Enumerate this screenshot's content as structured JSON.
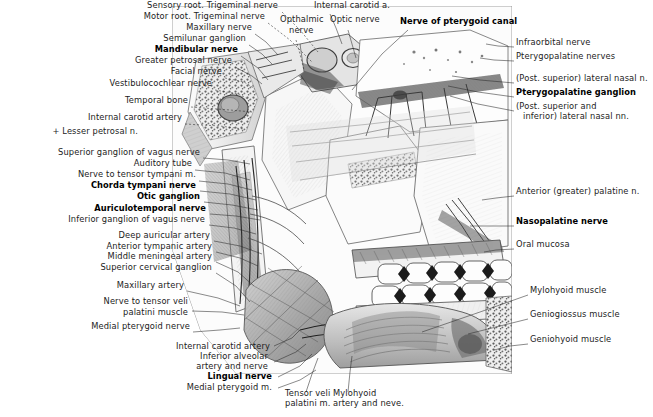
{
  "figure": {
    "kind": "anatomical-illustration",
    "background": "#ffffff",
    "ink": "#1c1c1c",
    "plate_bounds": {
      "x": 170,
      "y": 5,
      "width": 343,
      "height": 370
    }
  },
  "labels_left": [
    {
      "text": "Sensory root. Trigeminal nerve",
      "x": 278,
      "y": 8,
      "bold": false
    },
    {
      "text": "Motor root. Trigeminal nerve",
      "x": 265,
      "y": 19,
      "bold": false
    },
    {
      "text": "Maxillary nerve",
      "x": 252,
      "y": 30,
      "bold": false
    },
    {
      "text": "Semilunar ganglion",
      "x": 246,
      "y": 41,
      "bold": false
    },
    {
      "text": "Mandibular nerve",
      "x": 238,
      "y": 52,
      "bold": true
    },
    {
      "text": "Greater petrosal nerve",
      "x": 232,
      "y": 63,
      "bold": false
    },
    {
      "text": "Facial nerve",
      "x": 222,
      "y": 74,
      "bold": false
    },
    {
      "text": "Vestibulocochlear nerve",
      "x": 212,
      "y": 86,
      "bold": false
    },
    {
      "text": "Temporal bone",
      "x": 188,
      "y": 103,
      "bold": false
    },
    {
      "text": "Internal carotid artery",
      "x": 182,
      "y": 120,
      "bold": false
    },
    {
      "text": "+ Lesser petrosal n.",
      "x": 138,
      "y": 134,
      "bold": false
    },
    {
      "text": "Superior ganglion of vagus nerve",
      "x": 200,
      "y": 155,
      "bold": false
    },
    {
      "text": "Auditory tube",
      "x": 192,
      "y": 166,
      "bold": false
    },
    {
      "text": "Nerve to tensor tympani m.",
      "x": 196,
      "y": 177,
      "bold": false
    },
    {
      "text": "Chorda tympani nerve",
      "x": 196,
      "y": 188,
      "bold": true
    },
    {
      "text": "Otic ganglion",
      "x": 200,
      "y": 199,
      "bold": true
    },
    {
      "text": "Auriculotemporal nerve",
      "x": 206,
      "y": 211,
      "bold": true
    },
    {
      "text": "Inferior ganglion of vagus nerve",
      "x": 205,
      "y": 222,
      "bold": false
    },
    {
      "text": "Deep auricular artery",
      "x": 210,
      "y": 238,
      "bold": false
    },
    {
      "text": "Anterior tympanic artery",
      "x": 212,
      "y": 249,
      "bold": false
    },
    {
      "text": "Middle meningeal artery",
      "x": 212,
      "y": 259,
      "bold": false
    },
    {
      "text": "Superior cervical ganglion",
      "x": 212,
      "y": 270,
      "bold": false
    },
    {
      "text": "Maxillary artery",
      "x": 184,
      "y": 288,
      "bold": false
    },
    {
      "text": "Nerve to tensor veli",
      "x": 188,
      "y": 304,
      "bold": false
    },
    {
      "text": "palatini muscle",
      "x": 188,
      "y": 315,
      "bold": false
    },
    {
      "text": "Medial pterygoid nerve",
      "x": 190,
      "y": 329,
      "bold": false
    }
  ],
  "labels_bottom": [
    {
      "text": "Internal carotid artery",
      "x": 270,
      "y": 349,
      "bold": false,
      "align": "right"
    },
    {
      "text": "Inferior alveolar",
      "x": 268,
      "y": 359,
      "bold": false,
      "align": "right"
    },
    {
      "text": "artery and nerve",
      "x": 268,
      "y": 369,
      "bold": false,
      "align": "right"
    },
    {
      "text": "Lingual nerve",
      "x": 272,
      "y": 379,
      "bold": true,
      "align": "right"
    },
    {
      "text": "Medial pterygoid m.",
      "x": 272,
      "y": 390,
      "bold": false,
      "align": "right"
    },
    {
      "text": "Tensor veli",
      "x": 285,
      "y": 396,
      "bold": false,
      "align": "left"
    },
    {
      "text": "palatini m.",
      "x": 285,
      "y": 406,
      "bold": false,
      "align": "left"
    },
    {
      "text": "Mylohyoid",
      "x": 333,
      "y": 396,
      "bold": false,
      "align": "left"
    },
    {
      "text": "artery and neve.",
      "x": 333,
      "y": 406,
      "bold": false,
      "align": "left"
    }
  ],
  "labels_top_center": [
    {
      "text": "Internal carotid a.",
      "x": 314,
      "y": 8,
      "bold": false,
      "align": "left"
    },
    {
      "text": "Opthalmic",
      "x": 280,
      "y": 22,
      "bold": false,
      "align": "left"
    },
    {
      "text": "nerve",
      "x": 289,
      "y": 33,
      "bold": false,
      "align": "left"
    },
    {
      "text": "Optic nerve",
      "x": 330,
      "y": 22,
      "bold": false,
      "align": "left"
    },
    {
      "text": "Nerve of pterygoid canal",
      "x": 400,
      "y": 24,
      "bold": true,
      "align": "left"
    }
  ],
  "labels_right": [
    {
      "text": "Infraorbital nerve",
      "x": 516,
      "y": 45,
      "bold": false
    },
    {
      "text": "Pterygopalatine nerves",
      "x": 516,
      "y": 59,
      "bold": false
    },
    {
      "text": "(Post. superior) lateral nasal n.",
      "x": 516,
      "y": 81,
      "bold": false
    },
    {
      "text": "Pterygopalatine ganglion",
      "x": 516,
      "y": 95,
      "bold": true
    },
    {
      "text": "(Post. superior and",
      "x": 516,
      "y": 109,
      "bold": false
    },
    {
      "text": "inferior) lateral nasal nn.",
      "x": 523,
      "y": 119,
      "bold": false
    },
    {
      "text": "Anterior (greater) palatine n.",
      "x": 516,
      "y": 194,
      "bold": false
    },
    {
      "text": "Nasopalatine nerve",
      "x": 516,
      "y": 224,
      "bold": true
    },
    {
      "text": "Oral mucosa",
      "x": 516,
      "y": 247,
      "bold": false
    },
    {
      "text": "Mylohyoid muscle",
      "x": 530,
      "y": 293,
      "bold": false
    },
    {
      "text": "Geniogiossus muscle",
      "x": 530,
      "y": 317,
      "bold": false
    },
    {
      "text": "Geniohyoid muscle",
      "x": 530,
      "y": 342,
      "bold": false
    }
  ],
  "leaders": [
    {
      "name": "sensory-root",
      "d": "M 282 12 L 300 30 L 318 52",
      "dashed": true
    },
    {
      "name": "motor-root",
      "d": "M 268 23 L 290 40 L 312 62",
      "dashed": true
    },
    {
      "name": "maxillary-nerve",
      "d": "M 255 34 L 266 42 L 278 55",
      "dashed": false
    },
    {
      "name": "semilunar-ganglion",
      "d": "M 249 45 L 262 54 L 272 64",
      "dashed": false
    },
    {
      "name": "mandibular-nerve",
      "d": "M 241 56 L 258 68 L 268 80",
      "dashed": false
    },
    {
      "name": "greater-petrosal",
      "d": "M 235 67 L 252 76 L 262 84",
      "dashed": false
    },
    {
      "name": "facial-nerve",
      "d": "M 225 78 L 244 82 L 254 88",
      "dashed": true
    },
    {
      "name": "vestibulocochlear",
      "d": "M 215 90 L 238 94 L 250 100",
      "dashed": true
    },
    {
      "name": "temporal-bone",
      "d": "M 191 107 L 230 110 L 252 112",
      "dashed": true
    },
    {
      "name": "internal-carotid-a-l",
      "d": "M 185 124 L 220 126 L 243 129",
      "dashed": true
    },
    {
      "name": "sup-ganglion-vagus",
      "d": "M 203 158 L 228 160 L 250 164",
      "dashed": false
    },
    {
      "name": "auditory-tube",
      "d": "M 195 170 L 225 173 L 250 180",
      "dashed": false
    },
    {
      "name": "nerve-tensor-tympani",
      "d": "M 199 181 L 228 184 L 252 190",
      "dashed": false
    },
    {
      "name": "chorda-tympani",
      "d": "M 200 191 L 230 194 L 256 200",
      "dashed": false
    },
    {
      "name": "otic-ganglion",
      "d": "M 204 202 L 232 205 L 258 210",
      "dashed": false
    },
    {
      "name": "auriculotemporal",
      "d": "M 210 214 L 236 216 L 260 220",
      "dashed": false
    },
    {
      "name": "inf-ganglion-vagus",
      "d": "M 209 225 L 234 228 L 256 234",
      "dashed": false
    },
    {
      "name": "deep-auricular-a",
      "d": "M 214 241 L 240 246 L 262 254",
      "dashed": false
    },
    {
      "name": "anterior-tympanic-a",
      "d": "M 216 252 L 240 258 L 258 266",
      "dashed": false
    },
    {
      "name": "middle-meningeal-a",
      "d": "M 216 262 L 238 272 L 254 286",
      "dashed": false
    },
    {
      "name": "sup-cervical-gang",
      "d": "M 216 273 L 236 286 L 250 302",
      "dashed": false
    },
    {
      "name": "maxillary-artery",
      "d": "M 187 291 L 218 298 L 240 306",
      "dashed": false
    },
    {
      "name": "tensor-veli-pal-n",
      "d": "M 192 311 L 222 312 L 244 315",
      "dashed": false
    },
    {
      "name": "medial-pterygoid-n",
      "d": "M 193 332 L 220 330 L 240 328",
      "dashed": false
    },
    {
      "name": "int-carotid-a-b",
      "d": "M 274 346 L 292 338 L 300 330",
      "dashed": false
    },
    {
      "name": "inf-alveolar",
      "d": "M 274 362 L 296 352 L 306 344",
      "dashed": false
    },
    {
      "name": "lingual-nerve",
      "d": "M 278 377 L 300 366 L 312 354",
      "dashed": false
    },
    {
      "name": "medial-pterygoid-m",
      "d": "M 278 388 L 300 380 L 316 370",
      "dashed": false
    },
    {
      "name": "tensor-veli-pal-m",
      "d": "M 306 392 L 312 374 L 318 358",
      "dashed": false
    },
    {
      "name": "mylohyoid-a-n",
      "d": "M 348 392 L 350 372 L 352 356",
      "dashed": false
    },
    {
      "name": "internal-carotid-a-t",
      "d": "M 330 14 L 336 28 L 342 44",
      "dashed": false
    },
    {
      "name": "opthalmic-nerve",
      "d": "M 296 40 L 300 54 L 304 70",
      "dashed": true
    },
    {
      "name": "optic-nerve",
      "d": "M 348 30 L 352 44 L 356 58",
      "dashed": false
    },
    {
      "name": "nerve-pterygoid-canal",
      "d": "M 408 30 L 382 54 L 352 90",
      "dashed": false
    },
    {
      "name": "infraorbital-n",
      "d": "M 514 47 L 498 46 L 486 44",
      "dashed": false
    },
    {
      "name": "pterygopalatine-nn",
      "d": "M 514 61 L 494 60 L 480 58",
      "dashed": false
    },
    {
      "name": "post-sup-lat-nasal",
      "d": "M 514 83 L 480 80 L 452 76",
      "dashed": false
    },
    {
      "name": "pterygopalatine-gang",
      "d": "M 514 97 L 478 92 L 448 86",
      "dashed": false
    },
    {
      "name": "post-sup-inf-lat",
      "d": "M 514 111 L 478 104 L 450 96",
      "dashed": false
    },
    {
      "name": "anterior-palatine-n",
      "d": "M 514 196 L 496 198 L 482 200",
      "dashed": false
    },
    {
      "name": "nasopalatine-n",
      "d": "M 514 226 L 490 226 L 470 226",
      "dashed": false
    },
    {
      "name": "oral-mucosa",
      "d": "M 514 249 L 496 250 L 484 252",
      "dashed": false
    },
    {
      "name": "mylohyoid-muscle",
      "d": "M 528 295 L 480 312 L 422 332",
      "dashed": false
    },
    {
      "name": "genioglossus-muscle",
      "d": "M 528 319 L 500 326 L 468 334",
      "dashed": false
    },
    {
      "name": "geniohyoid-muscle",
      "d": "M 528 344 L 510 346 L 494 350",
      "dashed": false
    }
  ]
}
